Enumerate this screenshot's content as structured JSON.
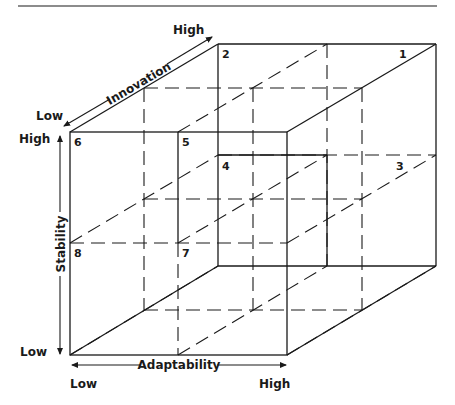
{
  "diagram": {
    "type": "3d-cube-matrix",
    "axes": {
      "innovation": {
        "label": "Innovation",
        "low": "Low",
        "high": "High"
      },
      "stability": {
        "label": "Stability",
        "low": "Low",
        "high": "High"
      },
      "adaptability": {
        "label": "Adaptability",
        "low": "Low",
        "high": "High"
      }
    },
    "cells": [
      {
        "id": "1",
        "label": "1"
      },
      {
        "id": "2",
        "label": "2"
      },
      {
        "id": "3",
        "label": "3"
      },
      {
        "id": "4",
        "label": "4"
      },
      {
        "id": "5",
        "label": "5"
      },
      {
        "id": "6",
        "label": "6"
      },
      {
        "id": "7",
        "label": "7"
      },
      {
        "id": "8",
        "label": "8"
      }
    ],
    "colors": {
      "line": "#1a1a1a",
      "background": "#ffffff"
    }
  }
}
